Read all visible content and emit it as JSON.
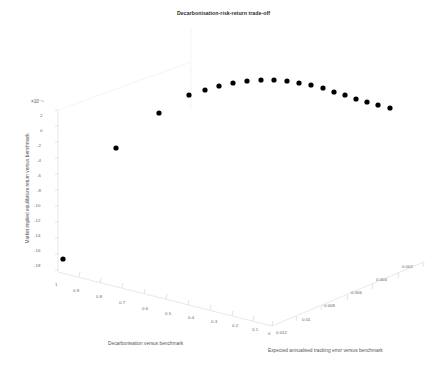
{
  "figure": {
    "title": "Decarbonisation-risk-return trade-off",
    "background": "#ffffff",
    "marker_color": "#000000",
    "axis_color": "#d9d9d9"
  },
  "chart_data": {
    "type": "scatter",
    "projection": "3d",
    "title": "Decarbonisation-risk-return trade-off",
    "xlabel": "Decarbonisation versus benchmark",
    "ylabel": "Market implied equilibrium return versus benchmark",
    "zlabel": "Expected annualised tracking error versus benchmark",
    "y_exponent": "×10⁻⁵",
    "xticks": [
      "1",
      "0.9",
      "0.8",
      "0.7",
      "0.6",
      "0.5",
      "0.4",
      "0.3",
      "0.2",
      "0.1",
      "0"
    ],
    "xtickvalues": [
      1,
      0.9,
      0.8,
      0.7,
      0.6,
      0.5,
      0.4,
      0.3,
      0.2,
      0.1,
      0
    ],
    "yticks": [
      "2",
      "0",
      "-2",
      "-4",
      "-6",
      "-8",
      "-10",
      "-12",
      "-14",
      "-16",
      "-18"
    ],
    "ytickvalues": [
      2,
      0,
      -2,
      -4,
      -6,
      -8,
      -10,
      -12,
      -14,
      -16,
      -18
    ],
    "zticks": [
      "0.012",
      "0.01",
      "0.008",
      "0.006",
      "0.004",
      "0.002"
    ],
    "ztickvalues": [
      0.012,
      0.01,
      0.008,
      0.006,
      0.004,
      0.002
    ],
    "xlim": [
      0,
      1
    ],
    "ylim": [
      -18,
      2
    ],
    "zlim": [
      0,
      0.012
    ],
    "grid": false,
    "legend": null,
    "series": [
      {
        "name": "efficient frontier",
        "marker": "filled-circle",
        "color": "#000000",
        "x": [
          0.95,
          0.85,
          0.75,
          0.7,
          0.65,
          0.6,
          0.55,
          0.5,
          0.45,
          0.4,
          0.35,
          0.3,
          0.26,
          0.22,
          0.18,
          0.15,
          0.12,
          0.09,
          0.06,
          0.03
        ],
        "y": [
          -17.2,
          -7.4,
          -1.4,
          0.55,
          1.05,
          1.25,
          1.3,
          1.28,
          1.22,
          1.12,
          1.0,
          0.86,
          0.7,
          0.52,
          0.34,
          0.16,
          -0.02,
          -0.2,
          -0.38,
          -0.52
        ],
        "z": [
          0.0005,
          0.0011,
          0.0018,
          0.0024,
          0.003,
          0.0036,
          0.0042,
          0.0048,
          0.0054,
          0.006,
          0.0066,
          0.0072,
          0.0077,
          0.0082,
          0.0087,
          0.0092,
          0.0097,
          0.0102,
          0.0107,
          0.0112
        ],
        "pixels": [
          {
            "px": 63,
            "py": 259
          },
          {
            "px": 116,
            "py": 148
          },
          {
            "px": 159,
            "py": 113
          },
          {
            "px": 189,
            "py": 95
          },
          {
            "px": 205,
            "py": 90
          },
          {
            "px": 219,
            "py": 86
          },
          {
            "px": 233,
            "py": 83
          },
          {
            "px": 247,
            "py": 81
          },
          {
            "px": 261,
            "py": 80
          },
          {
            "px": 274,
            "py": 80
          },
          {
            "px": 287,
            "py": 81
          },
          {
            "px": 299,
            "py": 83
          },
          {
            "px": 311,
            "py": 85
          },
          {
            "px": 323,
            "py": 88
          },
          {
            "px": 334,
            "py": 92
          },
          {
            "px": 345,
            "py": 95
          },
          {
            "px": 356,
            "py": 99
          },
          {
            "px": 367,
            "py": 102
          },
          {
            "px": 378,
            "py": 105
          },
          {
            "px": 390,
            "py": 108
          }
        ]
      }
    ]
  },
  "xticks_px": [
    {
      "label": "1",
      "x": 55,
      "y": 282
    },
    {
      "label": "0.9",
      "x": 73,
      "y": 288
    },
    {
      "label": "0.8",
      "x": 96,
      "y": 294
    },
    {
      "label": "0.7",
      "x": 119,
      "y": 300
    },
    {
      "label": "0.6",
      "x": 142,
      "y": 306
    },
    {
      "label": "0.5",
      "x": 165,
      "y": 311
    },
    {
      "label": "0.4",
      "x": 188,
      "y": 315
    },
    {
      "label": "0.3",
      "x": 211,
      "y": 319
    },
    {
      "label": "0.2",
      "x": 232,
      "y": 323
    },
    {
      "label": "0.1",
      "x": 252,
      "y": 327
    },
    {
      "label": "0",
      "x": 268,
      "y": 331
    }
  ],
  "yticks_px": [
    {
      "label": "2",
      "x": 40,
      "y": 113
    },
    {
      "label": "0",
      "x": 40,
      "y": 128
    },
    {
      "label": "-2",
      "x": 37,
      "y": 143
    },
    {
      "label": "-4",
      "x": 37,
      "y": 158
    },
    {
      "label": "-6",
      "x": 37,
      "y": 173
    },
    {
      "label": "-8",
      "x": 37,
      "y": 188
    },
    {
      "label": "-10",
      "x": 34,
      "y": 203
    },
    {
      "label": "-12",
      "x": 34,
      "y": 218
    },
    {
      "label": "-14",
      "x": 34,
      "y": 233
    },
    {
      "label": "-16",
      "x": 34,
      "y": 248
    },
    {
      "label": "-18",
      "x": 34,
      "y": 263
    }
  ],
  "zticks_px": [
    {
      "label": "0.012",
      "x": 276,
      "y": 330
    },
    {
      "label": "0.01",
      "x": 302,
      "y": 317
    },
    {
      "label": "0.008",
      "x": 324,
      "y": 303
    },
    {
      "label": "0.006",
      "x": 351,
      "y": 290
    },
    {
      "label": "0.004",
      "x": 376,
      "y": 277
    },
    {
      "label": "0.002",
      "x": 402,
      "y": 264
    }
  ]
}
